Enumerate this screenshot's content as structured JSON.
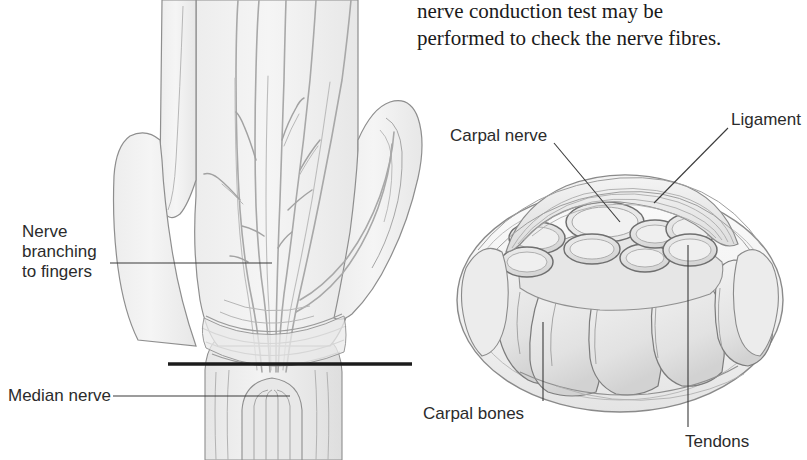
{
  "figure": {
    "caption_text": {
      "line1": "nerve conduction test may be",
      "line2": "performed to check the nerve fibres."
    },
    "palm_view": {
      "name": "palm-and-wrist-view",
      "section_line_label": "cross-section-plane-line",
      "labels": [
        {
          "id": "nerve-branching",
          "text_lines": [
            "Nerve",
            "branching",
            "to fingers"
          ],
          "text_x": 22,
          "text_y": 222,
          "leader": {
            "x1": 110,
            "y1": 263,
            "x2": 272,
            "y2": 263
          }
        },
        {
          "id": "median-nerve",
          "text_lines": [
            "Median nerve"
          ],
          "text_x": 8,
          "text_y": 386,
          "leader": {
            "x1": 113,
            "y1": 396,
            "x2": 290,
            "y2": 396
          }
        }
      ]
    },
    "cross_section_view": {
      "name": "carpal-tunnel-cross-section",
      "labels": [
        {
          "id": "carpal-nerve",
          "text_lines": [
            "Carpal nerve"
          ],
          "text_x": 450,
          "text_y": 126,
          "leader": {
            "x1": 554,
            "y1": 143,
            "x2": 620,
            "y2": 222
          }
        },
        {
          "id": "ligament",
          "text_lines": [
            "Ligament"
          ],
          "text_x": 731,
          "text_y": 110,
          "leader": {
            "x1": 728,
            "y1": 128,
            "x2": 654,
            "y2": 203
          }
        },
        {
          "id": "carpal-bones",
          "text_lines": [
            "Carpal bones"
          ],
          "text_x": 423,
          "text_y": 404,
          "leader": {
            "x1": 543,
            "y1": 322,
            "x2": 543,
            "y2": 401
          }
        },
        {
          "id": "tendons",
          "text_lines": [
            "Tendons"
          ],
          "text_x": 685,
          "text_y": 432,
          "leader": {
            "x1": 688,
            "y1": 245,
            "x2": 688,
            "y2": 427
          }
        }
      ]
    },
    "colors": {
      "background": "#ffffff",
      "tissue_fill": "#f1f1f1",
      "tissue_fill_mid": "#e3e3e3",
      "tissue_fill_dark": "#cfcfcf",
      "outline": "#8e8e8e",
      "outline_dark": "#6a6a6a",
      "nerve_stroke": "#a8a8a8",
      "section_line": "#1c1c1c",
      "leader_line": "#3a3a3a",
      "text": "#2b2b2b",
      "body_text": "#1a1a1a"
    }
  }
}
